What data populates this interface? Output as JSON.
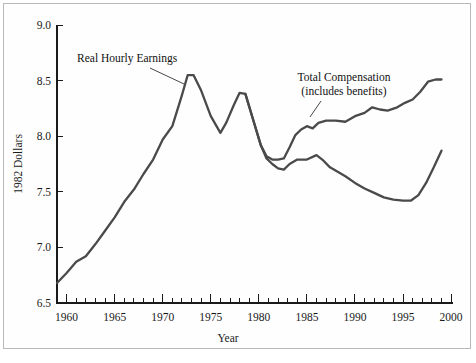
{
  "chart_data": {
    "type": "line",
    "title": "",
    "xlabel": "Year",
    "ylabel": "1982 Dollars",
    "xlim": [
      1959,
      2000
    ],
    "ylim": [
      6.5,
      9.0
    ],
    "grid": false,
    "legend_position": "inline-annotations",
    "y_ticks": [
      "6.5",
      "7.0",
      "7.5",
      "8.0",
      "8.5",
      "9.0"
    ],
    "y_tick_values": [
      6.5,
      7.0,
      7.5,
      8.0,
      8.5,
      9.0
    ],
    "x_ticks": [
      "1960",
      "1965",
      "1970",
      "1975",
      "1980",
      "1985",
      "1990",
      "1995",
      "2000"
    ],
    "x_tick_values": [
      1960,
      1965,
      1970,
      1975,
      1980,
      1985,
      1990,
      1995,
      2000
    ],
    "x_minor_step": 1,
    "line_color": "#4a4a4a",
    "annotations": [
      {
        "name": "real-hourly-earnings-label",
        "lines": [
          "Real Hourly Earnings"
        ],
        "x": 77,
        "y": 62,
        "anchor": "start",
        "leader": [
          [
            150,
            68
          ],
          [
            184,
            84
          ]
        ]
      },
      {
        "name": "total-compensation-label",
        "lines": [
          "Total Compensation",
          "(includes benefits)"
        ],
        "x": 344,
        "y": 81,
        "anchor": "middle",
        "leader": [
          [
            321,
            101
          ],
          [
            310,
            117
          ]
        ]
      }
    ],
    "series": [
      {
        "name": "Real Hourly Earnings",
        "points": [
          [
            1959.0,
            6.68
          ],
          [
            1960.0,
            6.77
          ],
          [
            1961.0,
            6.87
          ],
          [
            1962.0,
            6.92
          ],
          [
            1963.0,
            7.03
          ],
          [
            1964.0,
            7.15
          ],
          [
            1965.0,
            7.27
          ],
          [
            1966.0,
            7.41
          ],
          [
            1967.0,
            7.52
          ],
          [
            1968.0,
            7.66
          ],
          [
            1969.0,
            7.79
          ],
          [
            1970.0,
            7.97
          ],
          [
            1971.0,
            8.09
          ],
          [
            1972.0,
            8.37
          ],
          [
            1972.6,
            8.55
          ],
          [
            1973.2,
            8.55
          ],
          [
            1974.0,
            8.41
          ],
          [
            1975.0,
            8.18
          ],
          [
            1976.0,
            8.03
          ],
          [
            1976.6,
            8.12
          ],
          [
            1977.4,
            8.28
          ],
          [
            1978.0,
            8.39
          ],
          [
            1978.6,
            8.38
          ],
          [
            1979.4,
            8.15
          ],
          [
            1980.2,
            7.92
          ],
          [
            1980.8,
            7.8
          ],
          [
            1981.4,
            7.75
          ],
          [
            1982.0,
            7.71
          ],
          [
            1982.6,
            7.7
          ],
          [
            1983.2,
            7.75
          ],
          [
            1984.0,
            7.79
          ],
          [
            1985.0,
            7.79
          ],
          [
            1986.0,
            7.83
          ],
          [
            1986.6,
            7.79
          ],
          [
            1987.4,
            7.72
          ],
          [
            1988.2,
            7.68
          ],
          [
            1989.0,
            7.64
          ],
          [
            1990.0,
            7.58
          ],
          [
            1991.0,
            7.53
          ],
          [
            1992.0,
            7.49
          ],
          [
            1993.0,
            7.45
          ],
          [
            1994.0,
            7.43
          ],
          [
            1995.0,
            7.42
          ],
          [
            1995.8,
            7.42
          ],
          [
            1996.6,
            7.47
          ],
          [
            1997.4,
            7.58
          ],
          [
            1998.2,
            7.72
          ],
          [
            1999.0,
            7.87
          ]
        ]
      },
      {
        "name": "Total Compensation (includes benefits)",
        "points": [
          [
            1978.6,
            8.38
          ],
          [
            1979.4,
            8.15
          ],
          [
            1980.2,
            7.92
          ],
          [
            1980.8,
            7.82
          ],
          [
            1981.4,
            7.79
          ],
          [
            1982.0,
            7.79
          ],
          [
            1982.6,
            7.8
          ],
          [
            1983.2,
            7.9
          ],
          [
            1983.8,
            8.01
          ],
          [
            1984.4,
            8.06
          ],
          [
            1985.0,
            8.09
          ],
          [
            1985.6,
            8.07
          ],
          [
            1986.2,
            8.12
          ],
          [
            1987.0,
            8.14
          ],
          [
            1988.0,
            8.14
          ],
          [
            1989.0,
            8.13
          ],
          [
            1990.0,
            8.18
          ],
          [
            1991.0,
            8.21
          ],
          [
            1991.8,
            8.26
          ],
          [
            1992.6,
            8.24
          ],
          [
            1993.4,
            8.23
          ],
          [
            1994.4,
            8.26
          ],
          [
            1995.2,
            8.3
          ],
          [
            1996.0,
            8.33
          ],
          [
            1996.8,
            8.4
          ],
          [
            1997.6,
            8.49
          ],
          [
            1998.4,
            8.51
          ],
          [
            1999.0,
            8.51
          ]
        ]
      }
    ]
  }
}
